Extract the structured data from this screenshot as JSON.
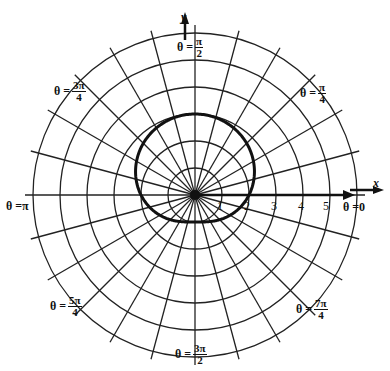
{
  "chart_data": {
    "type": "polar",
    "title": "",
    "curve": {
      "equation_form": "r = 2 + sin(theta)",
      "description": "limacon without inner loop",
      "samples": [
        {
          "theta": "0",
          "r": 2
        },
        {
          "theta": "pi/2",
          "r": 3
        },
        {
          "theta": "pi",
          "r": 2
        },
        {
          "theta": "3pi/2",
          "r": 1
        }
      ],
      "color": "#111111"
    },
    "grid": {
      "circles": [
        1,
        2,
        3,
        4,
        5,
        6
      ],
      "radial_step_deg": 15,
      "color": "#222222"
    },
    "axes": {
      "x_name": "x",
      "y_name": "y",
      "x_tick_labels": [
        "1",
        "2",
        "3",
        "4",
        "5"
      ]
    },
    "angle_labels": [
      {
        "id": "theta_0",
        "prefix": "θ = ",
        "whole": "0",
        "num": "",
        "den": ""
      },
      {
        "id": "theta_pi_4",
        "prefix": "θ = ",
        "whole": "",
        "num": "π",
        "den": "4"
      },
      {
        "id": "theta_pi_2",
        "prefix": "θ = ",
        "whole": "",
        "num": "π",
        "den": "2"
      },
      {
        "id": "theta_3pi_4",
        "prefix": "θ = ",
        "whole": "",
        "num": "3π",
        "den": "4"
      },
      {
        "id": "theta_pi",
        "prefix": "θ = ",
        "whole": "π",
        "num": "",
        "den": ""
      },
      {
        "id": "theta_5pi_4",
        "prefix": "θ = ",
        "whole": "",
        "num": "5π",
        "den": "4"
      },
      {
        "id": "theta_3pi_2",
        "prefix": "θ = ",
        "whole": "",
        "num": "3π",
        "den": "2"
      },
      {
        "id": "theta_7pi_4",
        "prefix": "θ = ",
        "whole": "",
        "num": "7π",
        "den": "4"
      }
    ]
  }
}
